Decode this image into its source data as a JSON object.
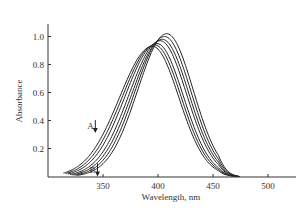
{
  "chart_data": {
    "type": "line",
    "title": "",
    "xlabel": "Wavelength, nm",
    "ylabel": "Absorbance",
    "xlim": [
      300,
      525
    ],
    "ylim": [
      0,
      1.1
    ],
    "xticks": [
      350,
      400,
      450,
      500
    ],
    "yticks": [
      0.2,
      0.4,
      0.6,
      0.8,
      1.0
    ],
    "xtick_labels": [
      "350",
      "400",
      "450",
      "500"
    ],
    "ytick_labels": [
      "0.2",
      "0.4",
      "0.6",
      "0.8",
      "1.0"
    ],
    "grid": false,
    "legend": null,
    "annotations": [
      {
        "text": "A",
        "x": 343,
        "y": 0.36,
        "arrow": "down"
      },
      {
        "text": "B",
        "x": 345,
        "y": 0.05,
        "arrow": "down"
      }
    ],
    "isosbestic_point": {
      "x": 393,
      "y": 0.91
    },
    "series": [
      {
        "name": "curve-1",
        "peak_x": 395,
        "peak_y": 0.93,
        "x": [
          314,
          340,
          360,
          380,
          395,
          410,
          430,
          450,
          474
        ],
        "y": [
          0.06,
          0.27,
          0.55,
          0.83,
          0.93,
          0.85,
          0.52,
          0.17,
          0.0
        ]
      },
      {
        "name": "curve-2",
        "peak_x": 397,
        "peak_y": 0.94,
        "x": [
          316,
          340,
          360,
          380,
          397,
          412,
          430,
          450,
          474
        ],
        "y": [
          0.06,
          0.24,
          0.51,
          0.8,
          0.94,
          0.87,
          0.56,
          0.18,
          0.0
        ]
      },
      {
        "name": "curve-3",
        "peak_x": 399,
        "peak_y": 0.95,
        "x": [
          318,
          340,
          360,
          380,
          399,
          414,
          430,
          450,
          474
        ],
        "y": [
          0.06,
          0.21,
          0.47,
          0.77,
          0.95,
          0.89,
          0.6,
          0.19,
          0.0
        ]
      },
      {
        "name": "curve-4",
        "peak_x": 402,
        "peak_y": 0.97,
        "x": [
          320,
          340,
          360,
          380,
          402,
          416,
          430,
          450,
          474
        ],
        "y": [
          0.06,
          0.19,
          0.43,
          0.73,
          0.97,
          0.91,
          0.63,
          0.2,
          0.0
        ]
      },
      {
        "name": "curve-5",
        "peak_x": 404,
        "peak_y": 0.98,
        "x": [
          322,
          340,
          360,
          380,
          404,
          418,
          430,
          450,
          474
        ],
        "y": [
          0.06,
          0.16,
          0.39,
          0.69,
          0.98,
          0.93,
          0.66,
          0.21,
          0.0
        ]
      },
      {
        "name": "curve-6",
        "peak_x": 406,
        "peak_y": 1.0,
        "x": [
          324,
          340,
          360,
          380,
          406,
          420,
          430,
          450,
          474
        ],
        "y": [
          0.06,
          0.14,
          0.35,
          0.65,
          1.0,
          0.95,
          0.69,
          0.22,
          0.0
        ]
      },
      {
        "name": "curve-7",
        "peak_x": 408,
        "peak_y": 1.02,
        "x": [
          326,
          340,
          360,
          380,
          408,
          422,
          430,
          450,
          474
        ],
        "y": [
          0.06,
          0.12,
          0.31,
          0.61,
          1.02,
          0.97,
          0.72,
          0.23,
          0.0
        ]
      }
    ]
  }
}
